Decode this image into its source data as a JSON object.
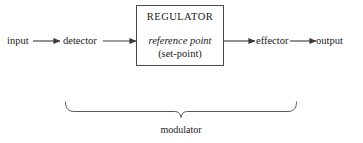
{
  "diagram": {
    "type": "flow-diagram",
    "background_color": "#ffffff",
    "line_color": "#3a3a3a",
    "text_color": "#1a1a1a",
    "nodes": {
      "input": {
        "label": "input"
      },
      "detector": {
        "label": "detector"
      },
      "regulator": {
        "title": "REGULATOR",
        "reference_point": "reference point",
        "set_point": "(set-point)"
      },
      "effector": {
        "label": "effector"
      },
      "output": {
        "label": "output"
      }
    },
    "brace": {
      "label": "modulator",
      "spans": "detector through effector"
    },
    "flow_sequence": [
      "input",
      "detector",
      "REGULATOR",
      "effector",
      "output"
    ],
    "arrows": [
      {
        "from": "input",
        "to": "detector"
      },
      {
        "from": "detector",
        "to": "regulator"
      },
      {
        "from": "regulator",
        "to": "effector"
      },
      {
        "from": "effector",
        "to": "output"
      }
    ]
  }
}
